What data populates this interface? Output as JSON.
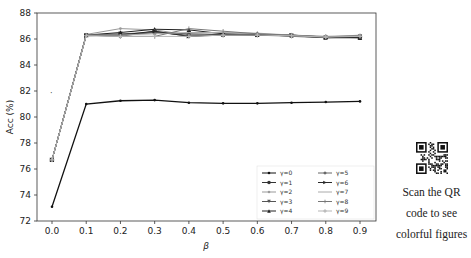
{
  "chart_data": {
    "type": "line",
    "title": "",
    "xlabel": "β",
    "ylabel": "Acc (%)",
    "x": [
      0.0,
      0.1,
      0.2,
      0.3,
      0.4,
      0.5,
      0.6,
      0.7,
      0.8,
      0.9
    ],
    "xticks": [
      "0.0",
      "0.1",
      "0.2",
      "0.3",
      "0.4",
      "0.5",
      "0.6",
      "0.7",
      "0.8",
      "0.9"
    ],
    "yticks": [
      "72",
      "74",
      "76",
      "78",
      "80",
      "82",
      "84",
      "86",
      "88"
    ],
    "ylim": [
      72,
      88
    ],
    "grid": false,
    "legend_position": "lower right",
    "series": [
      {
        "name": "γ=0",
        "values": [
          73.1,
          81.0,
          81.25,
          81.3,
          81.1,
          81.05,
          81.05,
          81.1,
          81.15,
          81.2
        ],
        "color": "#111111",
        "marker": "dot"
      },
      {
        "name": "γ=1",
        "values": [
          76.7,
          86.3,
          86.3,
          86.5,
          86.3,
          86.3,
          86.3,
          86.25,
          86.1,
          86.15
        ],
        "color": "#333333",
        "marker": "circle"
      },
      {
        "name": "γ=2",
        "values": [
          76.7,
          86.35,
          86.8,
          86.7,
          86.3,
          86.3,
          86.3,
          86.2,
          86.1,
          86.1
        ],
        "color": "#999999",
        "marker": "dot"
      },
      {
        "name": "γ=3",
        "values": [
          76.7,
          86.3,
          86.4,
          86.5,
          86.4,
          86.35,
          86.3,
          86.25,
          86.1,
          86.2
        ],
        "color": "#555555",
        "marker": "triangle-down"
      },
      {
        "name": "γ=4",
        "values": [
          76.7,
          86.3,
          86.5,
          86.75,
          86.7,
          86.4,
          86.35,
          86.3,
          86.15,
          86.1
        ],
        "color": "#222222",
        "marker": "triangle-up"
      },
      {
        "name": "γ=5",
        "values": [
          76.7,
          86.3,
          86.2,
          86.6,
          86.2,
          86.3,
          86.4,
          86.2,
          86.15,
          86.2
        ],
        "color": "#666666",
        "marker": "diamond"
      },
      {
        "name": "γ=6",
        "values": [
          76.7,
          86.25,
          86.3,
          86.6,
          86.2,
          86.35,
          86.3,
          86.3,
          86.1,
          86.1
        ],
        "color": "#2a2a2a",
        "marker": "triangle-right"
      },
      {
        "name": "γ=7",
        "values": [
          76.7,
          86.3,
          86.3,
          86.4,
          86.5,
          86.5,
          86.45,
          86.3,
          86.15,
          86.3
        ],
        "color": "#aaaaaa",
        "marker": "none"
      },
      {
        "name": "γ=8",
        "values": [
          76.7,
          86.3,
          86.2,
          86.2,
          86.8,
          86.6,
          86.4,
          86.3,
          86.2,
          86.25
        ],
        "color": "#777777",
        "marker": "tick"
      },
      {
        "name": "γ=9",
        "values": [
          76.7,
          86.25,
          86.2,
          86.2,
          86.2,
          86.3,
          86.3,
          86.25,
          86.15,
          86.2
        ],
        "color": "#b5b5b5",
        "marker": "plus"
      }
    ],
    "annotations": [
      {
        "text": "·",
        "x": 0.0,
        "y": 81.7
      }
    ]
  },
  "side_note": {
    "qr_alt": "QR code",
    "lines": [
      "Scan the QR",
      "code to see",
      "colorful figures"
    ]
  }
}
